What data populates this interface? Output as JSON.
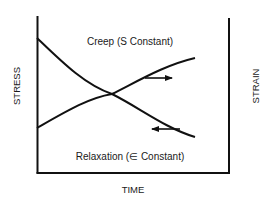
{
  "diagram": {
    "axes": {
      "x_label": "TIME",
      "y_left_label": "STRESS",
      "y_right_label": "STRAIN"
    },
    "curves": [
      {
        "name": "creep",
        "label": "Creep (S Constant)",
        "trend": "increasing",
        "arrow_direction": "right"
      },
      {
        "name": "relaxation",
        "label": "Relaxation (∈ Constant)",
        "trend": "decreasing",
        "arrow_direction": "left"
      }
    ],
    "colors": {
      "line": "#111111",
      "background": "#ffffff"
    }
  }
}
